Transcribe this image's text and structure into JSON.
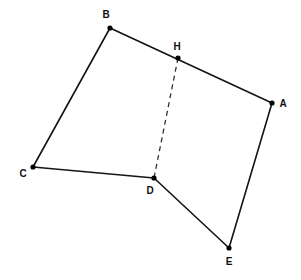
{
  "figure": {
    "background_color": "#ffffff",
    "width": 301,
    "height": 280,
    "line_color": "#141414",
    "dashed_line_color": "#2b2b2b",
    "label_color": "#111111",
    "vertex_dot_color": "#000000",
    "points": [
      {
        "id": "B",
        "label": "B",
        "x": 110,
        "y": 28,
        "label_x": 106,
        "label_y": 15,
        "dot_r": 2.6
      },
      {
        "id": "H",
        "label": "H",
        "x": 178,
        "y": 58,
        "label_x": 177,
        "label_y": 47,
        "dot_r": 2.6
      },
      {
        "id": "A",
        "label": "A",
        "x": 272,
        "y": 103,
        "label_x": 283,
        "label_y": 104,
        "dot_r": 2.6
      },
      {
        "id": "C",
        "label": "C",
        "x": 33,
        "y": 167,
        "label_x": 23,
        "label_y": 174,
        "dot_r": 2.6
      },
      {
        "id": "D",
        "label": "D",
        "x": 154,
        "y": 178,
        "label_x": 150,
        "label_y": 191,
        "dot_r": 2.6
      },
      {
        "id": "E",
        "label": "E",
        "x": 229,
        "y": 248,
        "label_x": 229,
        "label_y": 262,
        "dot_r": 2.6
      }
    ],
    "edges": [
      {
        "id": "B-A",
        "from": "B",
        "to": "A",
        "style": "solid",
        "name": "segment-ba"
      },
      {
        "id": "B-C",
        "from": "B",
        "to": "C",
        "style": "solid",
        "name": "segment-bc"
      },
      {
        "id": "C-D",
        "from": "C",
        "to": "D",
        "style": "solid",
        "name": "segment-cd"
      },
      {
        "id": "D-E",
        "from": "D",
        "to": "E",
        "style": "solid",
        "name": "segment-de"
      },
      {
        "id": "E-A",
        "from": "E",
        "to": "A",
        "style": "solid",
        "name": "segment-ea"
      },
      {
        "id": "H-D",
        "from": "H",
        "to": "D",
        "style": "dashed",
        "name": "segment-hd"
      }
    ]
  }
}
